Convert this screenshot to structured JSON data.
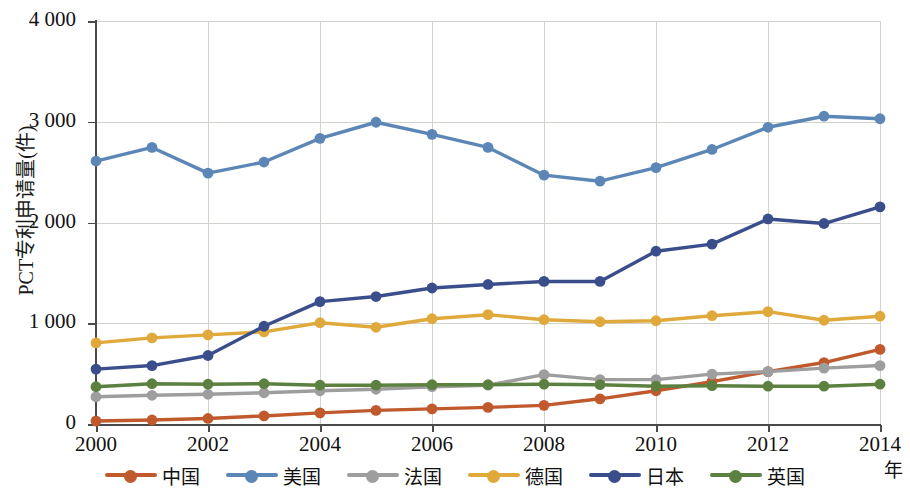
{
  "chart_data": {
    "type": "line",
    "title": "",
    "ylabel": "PCT专利申请量(件)",
    "xlabel": "年",
    "x": [
      2000,
      2001,
      2002,
      2003,
      2004,
      2005,
      2006,
      2007,
      2008,
      2009,
      2010,
      2011,
      2012,
      2013,
      2014
    ],
    "categories": [
      "2000",
      "2001",
      "2002",
      "2003",
      "2004",
      "2005",
      "2006",
      "2007",
      "2008",
      "2009",
      "2010",
      "2011",
      "2012",
      "2013",
      "2014"
    ],
    "xtick_labels": [
      "2000",
      "2002",
      "2004",
      "2006",
      "2008",
      "2010",
      "2012",
      "2014"
    ],
    "xtick_values": [
      2000,
      2002,
      2004,
      2006,
      2008,
      2010,
      2012,
      2014
    ],
    "ytick_labels": [
      "0",
      "1 000",
      "2 000",
      "3 000",
      "4 000"
    ],
    "ytick_values": [
      0,
      1000,
      2000,
      3000,
      4000
    ],
    "ylim": [
      0,
      4000
    ],
    "xlim": [
      2000,
      2014
    ],
    "grid": true,
    "legend_position": "bottom",
    "series": [
      {
        "name": "中国",
        "color": "#C05A2C",
        "values": [
          30,
          40,
          55,
          80,
          110,
          135,
          150,
          165,
          185,
          250,
          330,
          420,
          520,
          610,
          740
        ]
      },
      {
        "name": "美国",
        "color": "#5B86B5",
        "values": [
          2610,
          2745,
          2490,
          2600,
          2835,
          2995,
          2875,
          2745,
          2470,
          2410,
          2545,
          2725,
          2945,
          3055,
          3030
        ]
      },
      {
        "name": "法国",
        "color": "#9E9E9E",
        "values": [
          270,
          285,
          295,
          310,
          330,
          345,
          370,
          385,
          490,
          440,
          440,
          495,
          520,
          555,
          580
        ]
      },
      {
        "name": "德国",
        "color": "#E0A93B",
        "values": [
          805,
          855,
          885,
          915,
          1005,
          960,
          1045,
          1085,
          1035,
          1015,
          1025,
          1075,
          1115,
          1030,
          1070
        ]
      },
      {
        "name": "日本",
        "color": "#3A4E8C",
        "values": [
          545,
          580,
          680,
          970,
          1215,
          1265,
          1350,
          1385,
          1415,
          1415,
          1715,
          1785,
          2035,
          1990,
          2155
        ]
      },
      {
        "name": "英国",
        "color": "#5C8040",
        "values": [
          370,
          400,
          395,
          400,
          385,
          385,
          390,
          390,
          395,
          390,
          375,
          380,
          375,
          375,
          395
        ]
      }
    ]
  },
  "legend": {
    "items": [
      {
        "label": "中国",
        "color": "#C05A2C"
      },
      {
        "label": "美国",
        "color": "#5B86B5"
      },
      {
        "label": "法国",
        "color": "#9E9E9E"
      },
      {
        "label": "德国",
        "color": "#E0A93B"
      },
      {
        "label": "日本",
        "color": "#3A4E8C"
      },
      {
        "label": "英国",
        "color": "#5C8040"
      }
    ]
  },
  "axes": {
    "y_title": "PCT专利申请量(件)",
    "x_unit": "年"
  }
}
